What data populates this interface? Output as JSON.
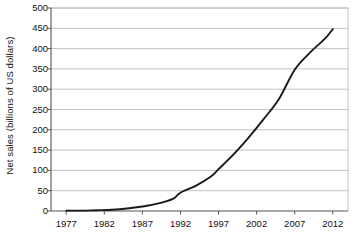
{
  "chart_data": {
    "type": "line",
    "title": "",
    "xlabel": "",
    "ylabel": "Net sales (billions of US dollars)",
    "xlim": [
      1975,
      2014
    ],
    "ylim": [
      0,
      500
    ],
    "grid": "horizontal",
    "legend": "none",
    "line_color": "#1a1a1a",
    "grid_color": "#b3b3b3",
    "axis_color": "#555555",
    "x_tick_labels": [
      "1977",
      "1982",
      "1987",
      "1992",
      "1997",
      "2002",
      "2007",
      "2012"
    ],
    "x_tick_values": [
      1977,
      1982,
      1987,
      1992,
      1997,
      2002,
      2007,
      2012
    ],
    "y_tick_labels": [
      "0",
      "50",
      "100",
      "150",
      "200",
      "250",
      "300",
      "350",
      "400",
      "450",
      "500"
    ],
    "y_tick_values": [
      0,
      50,
      100,
      150,
      200,
      250,
      300,
      350,
      400,
      450,
      500
    ],
    "series": [
      {
        "name": "Net sales",
        "x": [
          1977,
          1979,
          1981,
          1983,
          1985,
          1987,
          1989,
          1991,
          1992,
          1994,
          1996,
          1997,
          1999,
          2001,
          2003,
          2005,
          2007,
          2009,
          2011,
          2012
        ],
        "values": [
          1,
          1,
          2,
          3,
          6,
          11,
          18,
          30,
          45,
          62,
          85,
          103,
          140,
          182,
          228,
          278,
          348,
          390,
          425,
          448
        ]
      }
    ]
  }
}
